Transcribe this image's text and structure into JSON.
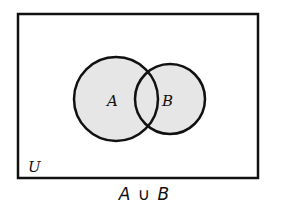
{
  "diagram": {
    "type": "venn",
    "universe": {
      "label": "U",
      "rect": {
        "x": 18,
        "y": 14,
        "width": 240,
        "height": 164
      }
    },
    "sets": [
      {
        "label": "A",
        "cx": 116,
        "cy": 99,
        "r": 42,
        "shaded": true
      },
      {
        "label": "B",
        "cx": 170,
        "cy": 99,
        "r": 35,
        "shaded": true
      }
    ],
    "shaded_region": "A ∪ B",
    "caption": "A ∪ B"
  },
  "colors": {
    "fill": "#e6e6e6",
    "stroke": "#111111",
    "background": "#ffffff"
  }
}
